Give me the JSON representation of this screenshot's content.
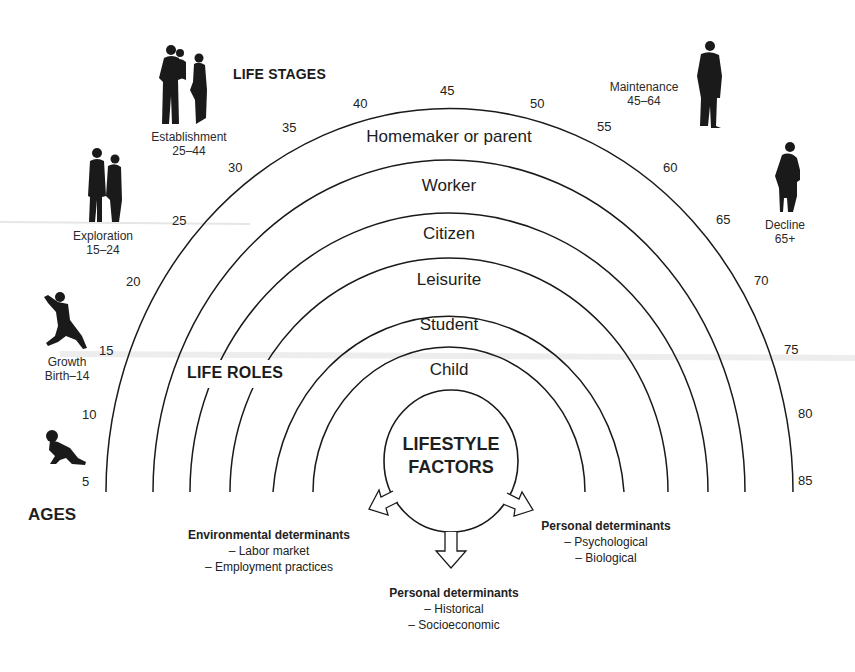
{
  "headings": {
    "life_stages": "LIFE STAGES",
    "life_roles": "LIFE ROLES",
    "ages": "AGES"
  },
  "center": {
    "line1": "LIFESTYLE",
    "line2": "FACTORS"
  },
  "life_roles": [
    {
      "label": "Homemaker or parent"
    },
    {
      "label": "Worker"
    },
    {
      "label": "Citizen"
    },
    {
      "label": "Leisurite"
    },
    {
      "label": "Student"
    },
    {
      "label": "Child"
    }
  ],
  "life_stages": [
    {
      "name": "Growth",
      "range": "Birth–14",
      "icon": "child-running-icon"
    },
    {
      "name": "Exploration",
      "range": "15–24",
      "icon": "young-couple-icon"
    },
    {
      "name": "Establishment",
      "range": "25–44",
      "icon": "family-icon"
    },
    {
      "name": "Maintenance",
      "range": "45–64",
      "icon": "adult-man-icon"
    },
    {
      "name": "Decline",
      "range": "65+",
      "icon": "elderly-person-icon"
    }
  ],
  "extra_icons": [
    "crawling-baby-icon"
  ],
  "ages": [
    "5",
    "10",
    "15",
    "20",
    "25",
    "30",
    "35",
    "40",
    "45",
    "50",
    "55",
    "60",
    "65",
    "70",
    "75",
    "80",
    "85"
  ],
  "determinants": {
    "environmental": {
      "title": "Environmental determinants",
      "items": [
        "– Labor market",
        "– Employment practices"
      ]
    },
    "personal_right": {
      "title": "Personal determinants",
      "items": [
        "– Psychological",
        "– Biological"
      ]
    },
    "personal_bottom": {
      "title": "Personal determinants",
      "items": [
        "– Historical",
        "– Socioeconomic"
      ]
    }
  },
  "colors": {
    "line": "#1a1a1a",
    "text": "#1f1f1f",
    "background": "#ffffff"
  }
}
